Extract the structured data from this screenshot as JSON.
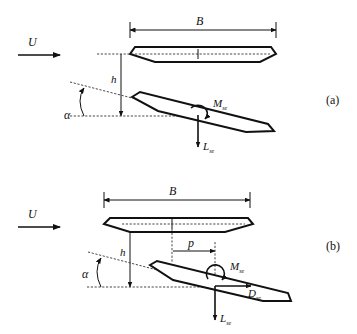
{
  "figure": {
    "panels": [
      {
        "id": "a",
        "panel_label": "(a)",
        "flow_label": "U",
        "width_label": "B",
        "height_label": "h",
        "angle_label": "α",
        "moment_label": "M",
        "moment_sub": "se",
        "lift_label": "L",
        "lift_sub": "se"
      },
      {
        "id": "b",
        "panel_label": "(b)",
        "flow_label": "U",
        "width_label": "B",
        "height_label": "h",
        "angle_label": "α",
        "offset_label": "p",
        "moment_label": "M",
        "moment_sub": "se",
        "drag_label": "D",
        "drag_sub": "se",
        "lift_label": "L",
        "lift_sub": "se"
      }
    ],
    "colors": {
      "stroke": "#111111",
      "background": "#ffffff"
    }
  }
}
